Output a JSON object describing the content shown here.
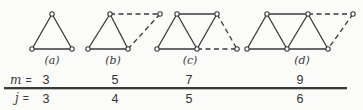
{
  "meta": {
    "background": "#fbfbf9",
    "ink": "#3a3a3a",
    "node_fill": "#ffffff"
  },
  "figures": [
    {
      "label": "(a)",
      "label_x": 52,
      "label_y": 64,
      "vertices": [
        [
          32,
          49
        ],
        [
          72,
          49
        ],
        [
          52,
          14
        ]
      ],
      "solid_edges": [
        [
          0,
          1
        ],
        [
          0,
          2
        ],
        [
          2,
          1
        ]
      ],
      "dashed_edges": []
    },
    {
      "label": "(b)",
      "label_x": 113,
      "label_y": 64,
      "vertices": [
        [
          88,
          49
        ],
        [
          128,
          49
        ],
        [
          110,
          14
        ],
        [
          160,
          14
        ]
      ],
      "solid_edges": [
        [
          0,
          1
        ],
        [
          0,
          2
        ],
        [
          2,
          1
        ]
      ],
      "dashed_edges": [
        [
          2,
          3
        ],
        [
          3,
          1
        ]
      ]
    },
    {
      "label": "(c)",
      "label_x": 190,
      "label_y": 64,
      "vertices": [
        [
          157,
          49
        ],
        [
          177,
          14
        ],
        [
          197,
          49
        ],
        [
          217,
          14
        ],
        [
          237,
          49
        ]
      ],
      "solid_edges": [
        [
          0,
          2
        ],
        [
          0,
          1
        ],
        [
          1,
          2
        ],
        [
          1,
          3
        ],
        [
          3,
          2
        ]
      ],
      "dashed_edges": [
        [
          2,
          4
        ],
        [
          3,
          4
        ]
      ]
    },
    {
      "label": "(d)",
      "label_x": 302,
      "label_y": 64,
      "vertices": [
        [
          247,
          49
        ],
        [
          267,
          14
        ],
        [
          287,
          49
        ],
        [
          308,
          14
        ],
        [
          328,
          49
        ],
        [
          353,
          14
        ]
      ],
      "solid_edges": [
        [
          0,
          2
        ],
        [
          2,
          4
        ],
        [
          0,
          1
        ],
        [
          1,
          2
        ],
        [
          1,
          3
        ],
        [
          3,
          2
        ],
        [
          3,
          4
        ]
      ],
      "dashed_edges": [
        [
          3,
          5
        ],
        [
          5,
          4
        ]
      ]
    }
  ],
  "table": {
    "rows": [
      {
        "label": "m",
        "eq": "=",
        "values": [
          "3",
          "5",
          "7",
          "9"
        ]
      },
      {
        "label": "j",
        "eq": "=",
        "values": [
          "3",
          "4",
          "5",
          "6"
        ]
      }
    ]
  }
}
